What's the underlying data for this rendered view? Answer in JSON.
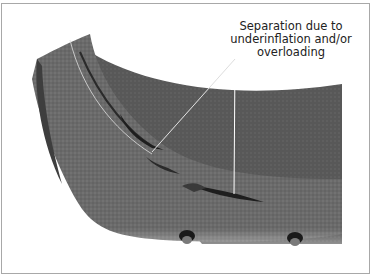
{
  "figure": {
    "callout": {
      "lines": [
        "Separation due to",
        "underinflation and/or",
        "overloading"
      ]
    },
    "colors": {
      "tread": "#6e6e6e",
      "tread_dark": "#4a4a4a",
      "inner_liner": "#5c5c5c",
      "separation_crack": "#1e1e1e",
      "leader_line": "#ffffff",
      "border": "#a8a8a8",
      "background": "#ffffff"
    }
  }
}
